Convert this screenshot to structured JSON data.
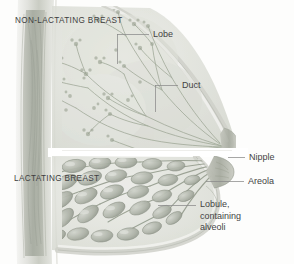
{
  "figure": {
    "background_color": "#fdfdfc",
    "ink_color": "#4a4a4a",
    "tissue_color": "#b9bdb4",
    "tissue_shadow_color": "#8e948a",
    "skin_color": "#d8d9d2",
    "leader_color": "#8a8a8a"
  },
  "sections": [
    {
      "id": "non-lactating",
      "label": "NON-LACTATING BREAST"
    },
    {
      "id": "lactating",
      "label": "LACTATING BREAST"
    }
  ],
  "callouts": [
    {
      "id": "lobe",
      "label": "Lobe"
    },
    {
      "id": "duct",
      "label": "Duct"
    },
    {
      "id": "nipple",
      "label": "Nipple"
    },
    {
      "id": "areola",
      "label": "Areola"
    },
    {
      "id": "lobule",
      "label": "Lobule,\ncontaining\nalveoli"
    }
  ]
}
